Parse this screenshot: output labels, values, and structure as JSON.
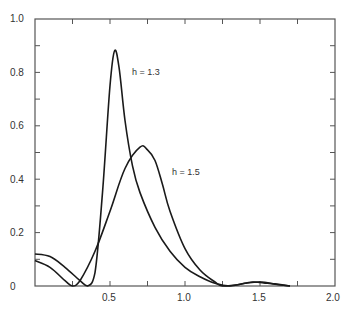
{
  "chart_data": {
    "type": "line",
    "title": "",
    "xlabel": "",
    "ylabel": "",
    "xlim": [
      0,
      2.0
    ],
    "ylim": [
      0,
      1.0
    ],
    "grid": false,
    "legend": "inline labels",
    "x_ticks": [
      0.5,
      1.0,
      1.5,
      2.0
    ],
    "x_tick_labels": [
      "0.5",
      "1.0",
      "1.5",
      "2.0"
    ],
    "x_minor_ticks": [
      0.25,
      0.75,
      1.25,
      1.75
    ],
    "y_ticks": [
      0,
      0.2,
      0.4,
      0.6,
      0.8,
      1.0
    ],
    "y_tick_labels": [
      "0",
      "0.2",
      "0.4",
      "0.6",
      "0.8",
      "1.0"
    ],
    "y_minor_ticks": [
      0.1,
      0.3,
      0.5,
      0.7,
      0.9
    ],
    "series": [
      {
        "name": "h = 1.3",
        "label_pos": [
          0.6,
          0.8
        ],
        "x": [
          0,
          0.1,
          0.2,
          0.3,
          0.35,
          0.4,
          0.45,
          0.5,
          0.53,
          0.56,
          0.6,
          0.65,
          0.7,
          0.8,
          0.9,
          1.0,
          1.1,
          1.2,
          1.3,
          1.4,
          1.5,
          1.6,
          1.7
        ],
        "values": [
          0.12,
          0.11,
          0.07,
          0.02,
          0.0,
          0.05,
          0.35,
          0.75,
          0.88,
          0.82,
          0.62,
          0.45,
          0.35,
          0.22,
          0.13,
          0.07,
          0.035,
          0.01,
          0.0,
          0.01,
          0.015,
          0.008,
          0.0
        ]
      },
      {
        "name": "h = 1.5",
        "label_pos": [
          0.9,
          0.42
        ],
        "x": [
          0,
          0.1,
          0.2,
          0.25,
          0.3,
          0.4,
          0.5,
          0.6,
          0.7,
          0.75,
          0.8,
          0.85,
          0.9,
          1.0,
          1.1,
          1.2,
          1.25,
          1.35,
          1.45,
          1.55,
          1.7
        ],
        "values": [
          0.095,
          0.07,
          0.02,
          0.0,
          0.02,
          0.13,
          0.28,
          0.44,
          0.52,
          0.51,
          0.47,
          0.38,
          0.28,
          0.14,
          0.06,
          0.015,
          0.0,
          0.005,
          0.015,
          0.01,
          0.0
        ]
      }
    ]
  },
  "labels": {
    "y0": "0",
    "y02": "0.2",
    "y04": "0.4",
    "y06": "0.6",
    "y08": "0.8",
    "y10": "1.0",
    "x05": "0.5",
    "x10": "1.0",
    "x15": "1.5",
    "x20": "2.0",
    "curve1": "h = 1.3",
    "curve2": "h = 1.5"
  }
}
